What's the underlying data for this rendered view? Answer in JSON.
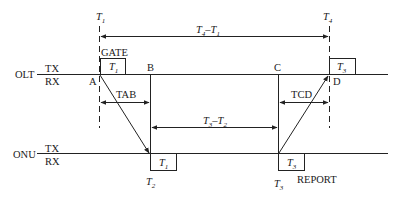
{
  "diagram": {
    "type": "timing-diagram",
    "rows": [
      {
        "name": "OLT",
        "tx": "TX",
        "rx": "RX"
      },
      {
        "name": "ONU",
        "tx": "TX",
        "rx": "RX"
      }
    ],
    "time_markers": {
      "t1": {
        "main": "T",
        "sub": "1"
      },
      "t2": {
        "main": "T",
        "sub": "2"
      },
      "t3": {
        "main": "T",
        "sub": "3"
      },
      "t4": {
        "main": "T",
        "sub": "4"
      }
    },
    "points": {
      "a": "A",
      "b": "B",
      "c": "C",
      "d": "D"
    },
    "messages": {
      "gate": "GATE",
      "report": "REPORT"
    },
    "boxes": {
      "olt_gate": {
        "main": "T",
        "sub": "1"
      },
      "olt_report": {
        "main": "T",
        "sub": "3"
      },
      "onu_gate": {
        "main": "T",
        "sub": "1"
      },
      "onu_report": {
        "main": "T",
        "sub": "3"
      }
    },
    "intervals": {
      "t4_t1": {
        "a": "T",
        "a_sub": "4",
        "sep": "–",
        "b": "T",
        "b_sub": "1"
      },
      "t3_t2": {
        "a": "T",
        "a_sub": "3",
        "sep": "–",
        "b": "T",
        "b_sub": "2"
      },
      "tab": "TAB",
      "tcd": "TCD"
    }
  }
}
